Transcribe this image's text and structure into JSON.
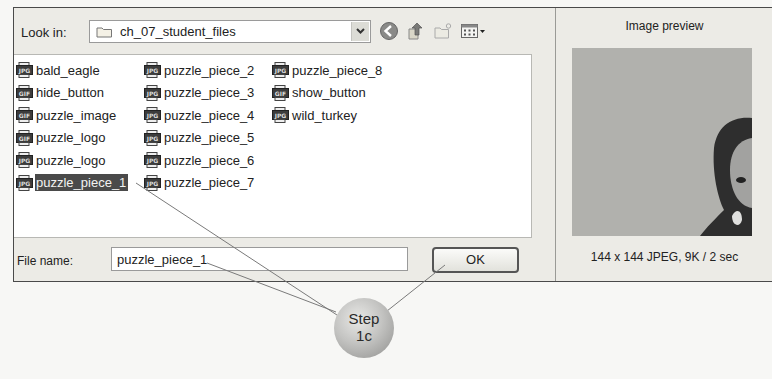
{
  "dialog": {
    "look_in_label": "Look in:",
    "look_in_value": "ch_07_student_files",
    "toolbar": [
      {
        "name": "back-icon"
      },
      {
        "name": "up-folder-icon"
      },
      {
        "name": "new-folder-icon"
      },
      {
        "name": "view-menu-icon"
      }
    ],
    "columns": [
      [
        {
          "label": "bald_eagle",
          "type": "JPG"
        },
        {
          "label": "hide_button",
          "type": "GIF"
        },
        {
          "label": "puzzle_image",
          "type": "GIF"
        },
        {
          "label": "puzzle_logo",
          "type": "GIF"
        },
        {
          "label": "puzzle_logo",
          "type": "JPG"
        },
        {
          "label": "puzzle_piece_1",
          "type": "JPG",
          "selected": true
        }
      ],
      [
        {
          "label": "puzzle_piece_2",
          "type": "JPG"
        },
        {
          "label": "puzzle_piece_3",
          "type": "JPG"
        },
        {
          "label": "puzzle_piece_4",
          "type": "JPG"
        },
        {
          "label": "puzzle_piece_5",
          "type": "JPG"
        },
        {
          "label": "puzzle_piece_6",
          "type": "JPG"
        },
        {
          "label": "puzzle_piece_7",
          "type": "JPG"
        }
      ],
      [
        {
          "label": "puzzle_piece_8",
          "type": "JPG"
        },
        {
          "label": "show_button",
          "type": "GIF"
        },
        {
          "label": "wild_turkey",
          "type": "JPG"
        }
      ]
    ],
    "file_name_label": "File name:",
    "file_name_value": "puzzle_piece_1",
    "ok_label": "OK",
    "preview": {
      "title": "Image preview",
      "info": "144 x 144 JPEG, 9K / 2 sec"
    }
  },
  "callout": {
    "line1": "Step",
    "line2": "1c"
  }
}
